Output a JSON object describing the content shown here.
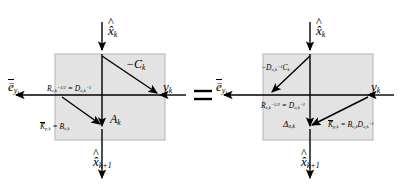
{
  "figure": {
    "type": "signal-flow-graph-equivalence",
    "relation": "=",
    "box_fill": "#e3e3e3",
    "box_stroke": "#b5b5b5",
    "line_color": "#000000",
    "background": "#ffffff"
  },
  "left_diagram": {
    "name": "left-block",
    "top_input": "x̂",
    "top_input_sub": "k",
    "bottom_output": "x̂",
    "bottom_output_sub": "k+1",
    "left_output": "ē",
    "left_output_sub": "y",
    "left_output_sub2": "k",
    "right_input": "y",
    "right_input_sub": "k",
    "edge_diagonal": "−C",
    "edge_diagonal_sub": "k",
    "edge_vertical": "A",
    "edge_vertical_sub": "k",
    "label_gain_top": "R",
    "label_gain_top_sub": "e,k",
    "label_gain_top_sup": "−1/2",
    "label_gain_top_eq": "=",
    "label_gain_top_rhs": "D",
    "label_gain_top_rhs_sub": "o,k",
    "label_gain_top_rhs_sup": "−1",
    "label_gain_bot": "K̄",
    "label_gain_bot_sub": "p,k",
    "label_gain_bot_eq": "=",
    "label_gain_bot_rhs": "B",
    "label_gain_bot_rhs_sub": "o,k"
  },
  "right_diagram": {
    "name": "right-block",
    "top_input": "x̂",
    "top_input_sub": "k",
    "bottom_output": "x̂",
    "bottom_output_sub": "k+1",
    "left_output": "ē",
    "left_output_sub": "y",
    "left_output_sub2": "k",
    "right_input": "y",
    "right_input_sub": "k",
    "edge_diagonal_upper": "−D",
    "edge_diagonal_upper_sub": "o,k",
    "edge_diagonal_upper_sup": "−1",
    "edge_diagonal_upper_tail": "C",
    "edge_diagonal_upper_tail_sub": "k",
    "edge_vertical": "Δ",
    "edge_vertical_sub": "o,k",
    "label_gain_top": "R",
    "label_gain_top_sub": "e,k",
    "label_gain_top_sup": "−1/2",
    "label_gain_top_eq": "=",
    "label_gain_top_rhs": "D",
    "label_gain_top_rhs_sub": "o,k",
    "label_gain_top_rhs_sup": "−1",
    "label_gain_bot": "K̄",
    "label_gain_bot_sub": "p,k",
    "label_gain_bot_eq": "=",
    "label_gain_bot_rhs1": "B",
    "label_gain_bot_rhs1_sub": "o,k",
    "label_gain_bot_rhs2": "D",
    "label_gain_bot_rhs2_sub": "o,k",
    "label_gain_bot_rhs2_sup": "−1"
  }
}
